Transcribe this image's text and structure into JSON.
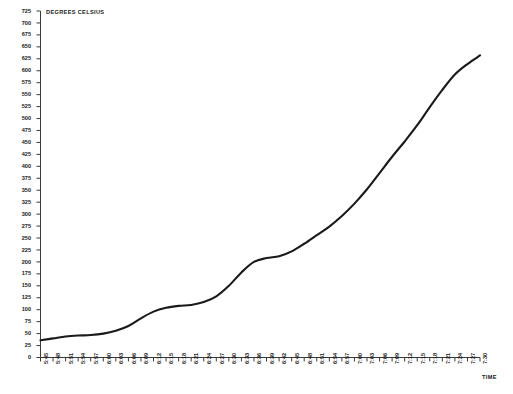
{
  "chart_data": {
    "type": "line",
    "title": "",
    "ylabel": "DEGREES CELSIUS",
    "xlabel": "TIME",
    "ylim": [
      0,
      725
    ],
    "ytick_step": 25,
    "grid": false,
    "legend": false,
    "yticks": [
      0,
      25,
      50,
      75,
      100,
      125,
      150,
      175,
      200,
      225,
      250,
      275,
      300,
      325,
      350,
      375,
      400,
      425,
      450,
      475,
      500,
      525,
      550,
      575,
      600,
      625,
      650,
      675,
      700,
      725
    ],
    "categories": [
      "5:45",
      "5:48",
      "5:51",
      "5:54",
      "5:57",
      "6:00",
      "6:03",
      "6:06",
      "6:09",
      "6:12",
      "6:15",
      "6:18",
      "6:21",
      "6:24",
      "6:27",
      "6:30",
      "6:33",
      "6:36",
      "6:39",
      "6:42",
      "6:45",
      "6:48",
      "6:51",
      "6:54",
      "6:57",
      "7:00",
      "7:03",
      "7:06",
      "7:09",
      "7:12",
      "7:15",
      "7:18",
      "7:21",
      "7:24",
      "7:27",
      "7:30"
    ],
    "values": [
      36,
      40,
      44,
      46,
      47,
      50,
      56,
      66,
      82,
      96,
      104,
      108,
      110,
      116,
      128,
      150,
      178,
      200,
      208,
      212,
      222,
      238,
      256,
      274,
      296,
      322,
      352,
      386,
      420,
      452,
      486,
      524,
      560,
      592,
      614,
      632
    ],
    "series_name": "temperature",
    "line_color": "#1a1a1a",
    "line_width": 2.1,
    "axis_color": "#3a3a3a"
  },
  "axes": {
    "y_axis_title": "DEGREES CELSIUS",
    "x_axis_title": "TIME"
  }
}
